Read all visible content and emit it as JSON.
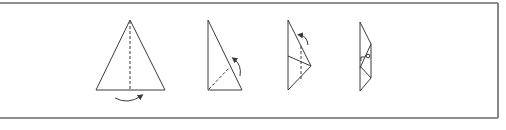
{
  "diagram": {
    "type": "origami-folding-steps",
    "stroke_color": "#3a3a3a",
    "frame_color": "#6a6a6a",
    "background": "#ffffff",
    "steps": [
      {
        "index": 1,
        "shape": "isosceles-triangle",
        "fold_line": "vertical-center-dashed",
        "arrow": "curved-below-left-to-right"
      },
      {
        "index": 2,
        "shape": "right-triangle",
        "fold_line": "diagonal-dashed",
        "arrow": "curved-right-upward"
      },
      {
        "index": 3,
        "shape": "folded-kite",
        "fold_line": "vertical-dashed",
        "arrow": "curved-top-left"
      },
      {
        "index": 4,
        "shape": "narrow-folded-strip",
        "marker": "small-circle"
      }
    ]
  }
}
